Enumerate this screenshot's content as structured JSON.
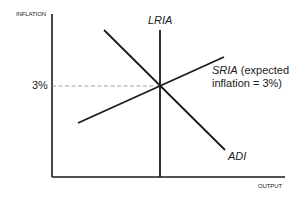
{
  "diagram": {
    "type": "economics-graph",
    "axes": {
      "y_label": "INFLATION",
      "x_label": "OUTPUT"
    },
    "tick": {
      "y_value_label": "3%"
    },
    "curves": [
      {
        "id": "LRIA",
        "label": "LRIA",
        "orientation": "vertical"
      },
      {
        "id": "SRIA",
        "label": "SRIA",
        "annotation_line1": " (expected",
        "annotation_line2": "inflation = 3%)",
        "orientation": "upward-sloping"
      },
      {
        "id": "ADI",
        "label": "ADI",
        "orientation": "downward-sloping"
      }
    ],
    "colors": {
      "line": "#1a1a1a",
      "dashed": "#888888"
    }
  }
}
